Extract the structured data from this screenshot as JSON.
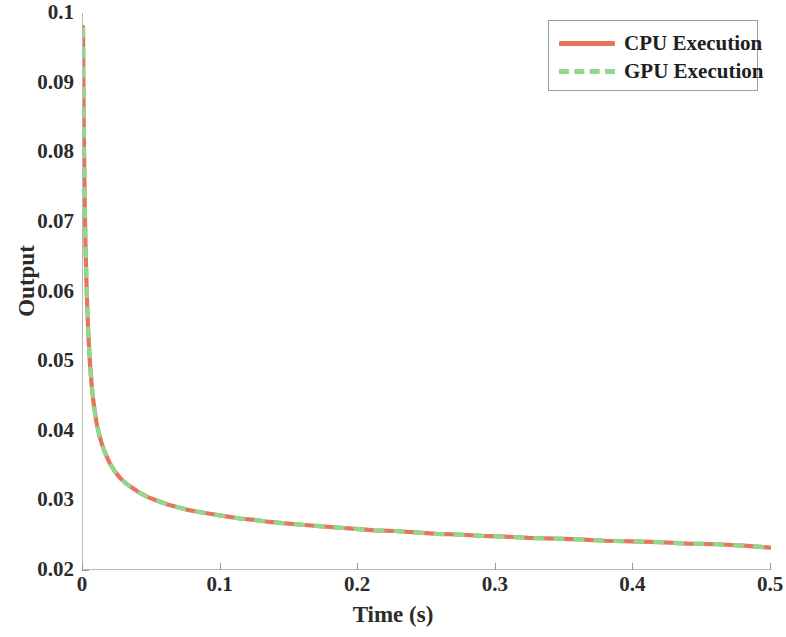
{
  "chart_data": {
    "type": "line",
    "title": "",
    "xlabel": "Time (s)",
    "ylabel": "Output",
    "xlim": [
      0,
      0.5
    ],
    "ylim": [
      0.02,
      0.1
    ],
    "xticks": [
      "0",
      "0.1",
      "0.2",
      "0.3",
      "0.4",
      "0.5"
    ],
    "xtick_values": [
      0,
      0.1,
      0.2,
      0.3,
      0.4,
      0.5
    ],
    "yticks": [
      "0.02",
      "0.03",
      "0.04",
      "0.05",
      "0.06",
      "0.07",
      "0.08",
      "0.09",
      "0.1"
    ],
    "ytick_values": [
      0.02,
      0.03,
      0.04,
      0.05,
      0.06,
      0.07,
      0.08,
      0.09,
      0.1
    ],
    "grid": false,
    "legend_position": "top-right",
    "colors": {
      "cpu": "#E8745C",
      "gpu": "#8FD88F",
      "axis": "#b9b9b9",
      "text": "#2b2b2b",
      "background": "#ffffff"
    },
    "series": [
      {
        "name": "CPU Execution",
        "style": "solid",
        "color": "#E8745C",
        "x": [
          0.0,
          0.0004,
          0.0008,
          0.0013,
          0.0018,
          0.0024,
          0.003,
          0.0038,
          0.0046,
          0.0056,
          0.0068,
          0.0082,
          0.0098,
          0.0118,
          0.014,
          0.0165,
          0.0195,
          0.023,
          0.027,
          0.0315,
          0.0365,
          0.042,
          0.048,
          0.0545,
          0.0615,
          0.069,
          0.077,
          0.0855,
          0.0945,
          0.104,
          0.114,
          0.1245,
          0.1355,
          0.147,
          0.159,
          0.1715,
          0.1845,
          0.198,
          0.212,
          0.2265,
          0.2415,
          0.257,
          0.273,
          0.2895,
          0.3065,
          0.324,
          0.342,
          0.3605,
          0.3795,
          0.399,
          0.419,
          0.4395,
          0.4605,
          0.48,
          0.5
        ],
        "y": [
          0.098,
          0.087,
          0.079,
          0.0722,
          0.0668,
          0.062,
          0.0582,
          0.0543,
          0.0512,
          0.0482,
          0.0455,
          0.0432,
          0.0412,
          0.0394,
          0.0379,
          0.0366,
          0.0353,
          0.0342,
          0.0332,
          0.0324,
          0.0317,
          0.031,
          0.0304,
          0.0299,
          0.0294,
          0.029,
          0.0286,
          0.0283,
          0.028,
          0.0277,
          0.0274,
          0.0272,
          0.0269,
          0.0267,
          0.0265,
          0.0263,
          0.0261,
          0.0259,
          0.0257,
          0.0256,
          0.0254,
          0.0252,
          0.0251,
          0.0249,
          0.0248,
          0.0246,
          0.0245,
          0.0244,
          0.0242,
          0.0241,
          0.024,
          0.0238,
          0.0237,
          0.0235,
          0.0232
        ]
      },
      {
        "name": "GPU Execution",
        "style": "dashed",
        "color": "#8FD88F",
        "x": [
          0.0,
          0.0004,
          0.0008,
          0.0013,
          0.0018,
          0.0024,
          0.003,
          0.0038,
          0.0046,
          0.0056,
          0.0068,
          0.0082,
          0.0098,
          0.0118,
          0.014,
          0.0165,
          0.0195,
          0.023,
          0.027,
          0.0315,
          0.0365,
          0.042,
          0.048,
          0.0545,
          0.0615,
          0.069,
          0.077,
          0.0855,
          0.0945,
          0.104,
          0.114,
          0.1245,
          0.1355,
          0.147,
          0.159,
          0.1715,
          0.1845,
          0.198,
          0.212,
          0.2265,
          0.2415,
          0.257,
          0.273,
          0.2895,
          0.3065,
          0.324,
          0.342,
          0.3605,
          0.3795,
          0.399,
          0.419,
          0.4395,
          0.4605,
          0.48,
          0.5
        ],
        "y": [
          0.098,
          0.087,
          0.079,
          0.0722,
          0.0668,
          0.062,
          0.0582,
          0.0543,
          0.0512,
          0.0482,
          0.0455,
          0.0432,
          0.0412,
          0.0394,
          0.0379,
          0.0366,
          0.0353,
          0.0342,
          0.0332,
          0.0324,
          0.0317,
          0.031,
          0.0304,
          0.0299,
          0.0294,
          0.029,
          0.0286,
          0.0283,
          0.028,
          0.0277,
          0.0274,
          0.0272,
          0.0269,
          0.0267,
          0.0265,
          0.0263,
          0.0261,
          0.0259,
          0.0257,
          0.0256,
          0.0254,
          0.0252,
          0.0251,
          0.0249,
          0.0248,
          0.0246,
          0.0245,
          0.0244,
          0.0242,
          0.0241,
          0.024,
          0.0238,
          0.0237,
          0.0235,
          0.0232
        ]
      }
    ]
  },
  "legend": {
    "entries": [
      {
        "label": "CPU Execution"
      },
      {
        "label": "GPU Execution"
      }
    ]
  }
}
